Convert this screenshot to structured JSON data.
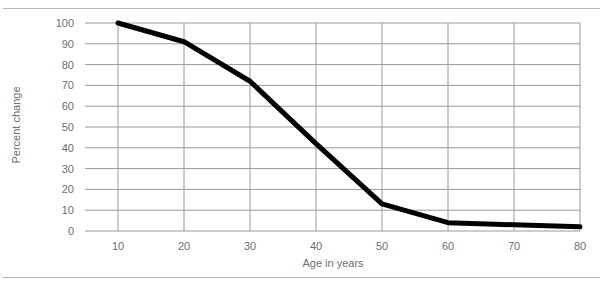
{
  "chart_data": {
    "type": "line",
    "title": "",
    "xlabel": "Age in years",
    "ylabel": "Percent change",
    "x": [
      10,
      20,
      30,
      40,
      50,
      60,
      70,
      80
    ],
    "values": [
      100,
      91,
      72,
      42,
      13,
      4,
      3,
      2
    ],
    "series": [
      {
        "name": "Percent change",
        "values": [
          100,
          91,
          72,
          42,
          13,
          4,
          3,
          2
        ],
        "color": "#000000"
      }
    ],
    "xlim": [
      5,
      80
    ],
    "ylim": [
      0,
      100
    ],
    "x_ticks": [
      10,
      20,
      30,
      40,
      50,
      60,
      70,
      80
    ],
    "y_ticks": [
      0,
      10,
      20,
      30,
      40,
      50,
      60,
      70,
      80,
      90,
      100
    ],
    "x_tick_labels": [
      "10",
      "20",
      "30",
      "40",
      "50",
      "60",
      "70",
      "80"
    ],
    "y_tick_labels": [
      "0",
      "10",
      "20",
      "30",
      "40",
      "50",
      "60",
      "70",
      "80",
      "90",
      "100"
    ],
    "grid": true,
    "grid_color": "#9a9a9a",
    "legend": "none",
    "line_color": "#000000",
    "line_width": 5,
    "label_color": "#6e6e6e",
    "background": "#ffffff",
    "rule_color": "#b9b9b9"
  }
}
